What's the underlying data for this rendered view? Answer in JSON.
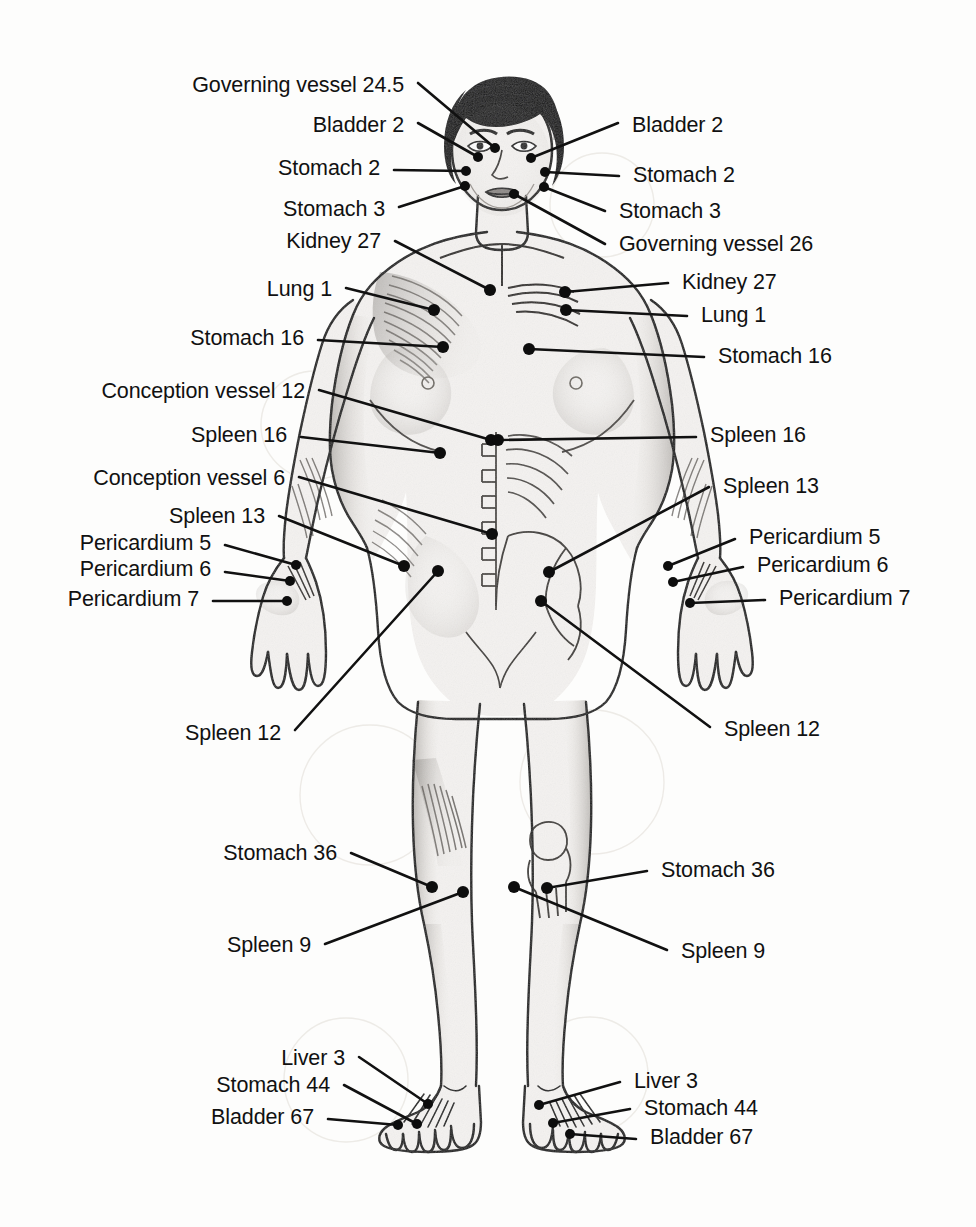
{
  "diagram": {
    "style": {
      "background": "#fdfdfc",
      "ink": "#111111",
      "point_color": "#0d0d0d",
      "skin_light": "#f2f0ee",
      "shade_mid": "#b9b4ae",
      "shade_dark": "#6e6a66",
      "hair_color": "#111111",
      "watermark_circle": "#e2ded8"
    }
  },
  "labels_left": [
    {
      "id": "gv245-l",
      "text": "Governing vessel 24.5",
      "x": 404,
      "y": 90,
      "tip_x": 495,
      "tip_y": 148,
      "elbow_x": 418,
      "elbow_y": 83
    },
    {
      "id": "bl2-l",
      "text": "Bladder 2",
      "x": 404,
      "y": 130,
      "tip_x": 478,
      "tip_y": 157,
      "elbow_x": 418,
      "elbow_y": 123
    },
    {
      "id": "st2-l",
      "text": "Stomach 2",
      "x": 380,
      "y": 173,
      "tip_x": 466,
      "tip_y": 171,
      "elbow_x": 394,
      "elbow_y": 170
    },
    {
      "id": "st3-l",
      "text": "Stomach 3",
      "x": 385,
      "y": 214,
      "tip_x": 465,
      "tip_y": 186,
      "elbow_x": 399,
      "elbow_y": 207
    },
    {
      "id": "ki27-l",
      "text": "Kidney 27",
      "x": 381,
      "y": 246,
      "tip_x": 490,
      "tip_y": 290,
      "elbow_x": 395,
      "elbow_y": 241
    },
    {
      "id": "lu1-l",
      "text": "Lung 1",
      "x": 332,
      "y": 294,
      "tip_x": 434,
      "tip_y": 310,
      "elbow_x": 346,
      "elbow_y": 288
    },
    {
      "id": "st16-l",
      "text": "Stomach 16",
      "x": 304,
      "y": 343,
      "tip_x": 443,
      "tip_y": 347,
      "elbow_x": 318,
      "elbow_y": 340
    },
    {
      "id": "cv12-l",
      "text": "Conception vessel 12",
      "x": 305,
      "y": 396,
      "tip_x": 491,
      "tip_y": 440,
      "elbow_x": 319,
      "elbow_y": 390
    },
    {
      "id": "sp16-l",
      "text": "Spleen 16",
      "x": 287,
      "y": 440,
      "tip_x": 440,
      "tip_y": 453,
      "elbow_x": 301,
      "elbow_y": 437
    },
    {
      "id": "cv6-l",
      "text": "Conception vessel 6",
      "x": 285,
      "y": 483,
      "tip_x": 492,
      "tip_y": 534,
      "elbow_x": 299,
      "elbow_y": 477
    },
    {
      "id": "sp13-l",
      "text": "Spleen 13",
      "x": 265,
      "y": 521,
      "tip_x": 404,
      "tip_y": 566,
      "elbow_x": 279,
      "elbow_y": 516
    },
    {
      "id": "pc5-l",
      "text": "Pericardium 5",
      "x": 211,
      "y": 548,
      "tip_x": 296,
      "tip_y": 565,
      "elbow_x": 225,
      "elbow_y": 545
    },
    {
      "id": "pc6-l",
      "text": "Pericardium 6",
      "x": 211,
      "y": 574,
      "tip_x": 290,
      "tip_y": 581,
      "elbow_x": 225,
      "elbow_y": 572
    },
    {
      "id": "pc7-l",
      "text": "Pericardium 7",
      "x": 199,
      "y": 604,
      "tip_x": 287,
      "tip_y": 601,
      "elbow_x": 213,
      "elbow_y": 601
    },
    {
      "id": "sp12-l",
      "text": "Spleen 12",
      "x": 281,
      "y": 738,
      "tip_x": 438,
      "tip_y": 571,
      "elbow_x": 295,
      "elbow_y": 730
    },
    {
      "id": "st36-l",
      "text": "Stomach 36",
      "x": 337,
      "y": 858,
      "tip_x": 432,
      "tip_y": 887,
      "elbow_x": 351,
      "elbow_y": 853
    },
    {
      "id": "sp9-l",
      "text": "Spleen 9",
      "x": 311,
      "y": 950,
      "tip_x": 463,
      "tip_y": 892,
      "elbow_x": 325,
      "elbow_y": 944
    },
    {
      "id": "lv3-l",
      "text": "Liver 3",
      "x": 345,
      "y": 1063,
      "tip_x": 428,
      "tip_y": 1104,
      "elbow_x": 359,
      "elbow_y": 1057
    },
    {
      "id": "st44-l",
      "text": "Stomach 44",
      "x": 330,
      "y": 1090,
      "tip_x": 417,
      "tip_y": 1124,
      "elbow_x": 344,
      "elbow_y": 1085
    },
    {
      "id": "bl67-l",
      "text": "Bladder 67",
      "x": 314,
      "y": 1122,
      "tip_x": 398,
      "tip_y": 1125,
      "elbow_x": 328,
      "elbow_y": 1119
    }
  ],
  "labels_right": [
    {
      "id": "bl2-r",
      "text": "Bladder 2",
      "x": 632,
      "y": 130,
      "tip_x": 531,
      "tip_y": 158,
      "elbow_x": 618,
      "elbow_y": 123
    },
    {
      "id": "st2-r",
      "text": "Stomach 2",
      "x": 633,
      "y": 180,
      "tip_x": 545,
      "tip_y": 172,
      "elbow_x": 619,
      "elbow_y": 176
    },
    {
      "id": "st3-r",
      "text": "Stomach 3",
      "x": 619,
      "y": 216,
      "tip_x": 544,
      "tip_y": 187,
      "elbow_x": 605,
      "elbow_y": 211
    },
    {
      "id": "gv26-r",
      "text": "Governing vessel 26",
      "x": 619,
      "y": 249,
      "tip_x": 514,
      "tip_y": 194,
      "elbow_x": 605,
      "elbow_y": 244
    },
    {
      "id": "ki27-r",
      "text": "Kidney 27",
      "x": 682,
      "y": 287,
      "tip_x": 565,
      "tip_y": 292,
      "elbow_x": 668,
      "elbow_y": 283
    },
    {
      "id": "lu1-r",
      "text": "Lung 1",
      "x": 701,
      "y": 320,
      "tip_x": 566,
      "tip_y": 310,
      "elbow_x": 687,
      "elbow_y": 316
    },
    {
      "id": "st16-r",
      "text": "Stomach 16",
      "x": 718,
      "y": 361,
      "tip_x": 529,
      "tip_y": 349,
      "elbow_x": 704,
      "elbow_y": 357
    },
    {
      "id": "sp16-r",
      "text": "Spleen 16",
      "x": 710,
      "y": 440,
      "tip_x": 498,
      "tip_y": 440,
      "elbow_x": 696,
      "elbow_y": 437
    },
    {
      "id": "sp13-r",
      "text": "Spleen 13",
      "x": 723,
      "y": 491,
      "tip_x": 549,
      "tip_y": 572,
      "elbow_x": 709,
      "elbow_y": 487
    },
    {
      "id": "pc5-r",
      "text": "Pericardium 5",
      "x": 749,
      "y": 542,
      "tip_x": 668,
      "tip_y": 566,
      "elbow_x": 735,
      "elbow_y": 539
    },
    {
      "id": "pc6-r",
      "text": "Pericardium 6",
      "x": 757,
      "y": 570,
      "tip_x": 673,
      "tip_y": 582,
      "elbow_x": 743,
      "elbow_y": 567
    },
    {
      "id": "pc7-r",
      "text": "Pericardium 7",
      "x": 779,
      "y": 603,
      "tip_x": 690,
      "tip_y": 603,
      "elbow_x": 765,
      "elbow_y": 600
    },
    {
      "id": "sp12-r",
      "text": "Spleen 12",
      "x": 724,
      "y": 734,
      "tip_x": 541,
      "tip_y": 601,
      "elbow_x": 710,
      "elbow_y": 727
    },
    {
      "id": "st36-r",
      "text": "Stomach 36",
      "x": 661,
      "y": 875,
      "tip_x": 547,
      "tip_y": 888,
      "elbow_x": 647,
      "elbow_y": 871
    },
    {
      "id": "sp9-r",
      "text": "Spleen 9",
      "x": 681,
      "y": 956,
      "tip_x": 514,
      "tip_y": 887,
      "elbow_x": 667,
      "elbow_y": 950
    },
    {
      "id": "lv3-r",
      "text": "Liver 3",
      "x": 634,
      "y": 1086,
      "tip_x": 539,
      "tip_y": 1105,
      "elbow_x": 620,
      "elbow_y": 1082
    },
    {
      "id": "st44-r",
      "text": "Stomach 44",
      "x": 644,
      "y": 1113,
      "tip_x": 553,
      "tip_y": 1123,
      "elbow_x": 630,
      "elbow_y": 1109
    },
    {
      "id": "bl67-r",
      "text": "Bladder 67",
      "x": 650,
      "y": 1142,
      "tip_x": 570,
      "tip_y": 1134,
      "elbow_x": 636,
      "elbow_y": 1139
    }
  ],
  "points": [
    {
      "id": "gv245",
      "label": "Governing vessel 24.5",
      "x": 495,
      "y": 148,
      "r": 5
    },
    {
      "id": "bl2-a",
      "label": "Bladder 2",
      "x": 478,
      "y": 157,
      "r": 5
    },
    {
      "id": "bl2-b",
      "label": "Bladder 2",
      "x": 531,
      "y": 158,
      "r": 5
    },
    {
      "id": "st2-a",
      "label": "Stomach 2",
      "x": 466,
      "y": 171,
      "r": 5
    },
    {
      "id": "st2-b",
      "label": "Stomach 2",
      "x": 545,
      "y": 172,
      "r": 5
    },
    {
      "id": "st3-a",
      "label": "Stomach 3",
      "x": 465,
      "y": 186,
      "r": 5
    },
    {
      "id": "st3-b",
      "label": "Stomach 3",
      "x": 544,
      "y": 187,
      "r": 5
    },
    {
      "id": "gv26",
      "label": "Governing vessel 26",
      "x": 514,
      "y": 194,
      "r": 5
    },
    {
      "id": "ki27a",
      "label": "Kidney 27",
      "x": 490,
      "y": 290,
      "r": 6
    },
    {
      "id": "ki27b",
      "label": "Kidney 27",
      "x": 565,
      "y": 292,
      "r": 6
    },
    {
      "id": "lu1a",
      "label": "Lung 1",
      "x": 434,
      "y": 310,
      "r": 6
    },
    {
      "id": "lu1b",
      "label": "Lung 1",
      "x": 566,
      "y": 310,
      "r": 6
    },
    {
      "id": "st16a",
      "label": "Stomach 16",
      "x": 443,
      "y": 347,
      "r": 6
    },
    {
      "id": "st16b",
      "label": "Stomach 16",
      "x": 529,
      "y": 349,
      "r": 6
    },
    {
      "id": "cv12",
      "label": "Conception vessel 12",
      "x": 491,
      "y": 440,
      "r": 6
    },
    {
      "id": "sp16a",
      "label": "Spleen 16",
      "x": 440,
      "y": 453,
      "r": 6
    },
    {
      "id": "sp16b",
      "label": "Spleen 16",
      "x": 498,
      "y": 440,
      "r": 6
    },
    {
      "id": "cv6",
      "label": "Conception vessel 6",
      "x": 492,
      "y": 534,
      "r": 6
    },
    {
      "id": "sp13a",
      "label": "Spleen 13",
      "x": 404,
      "y": 566,
      "r": 6
    },
    {
      "id": "sp13b",
      "label": "Spleen 13",
      "x": 549,
      "y": 572,
      "r": 6
    },
    {
      "id": "sp12a",
      "label": "Spleen 12",
      "x": 438,
      "y": 571,
      "r": 6
    },
    {
      "id": "sp12b",
      "label": "Spleen 12",
      "x": 541,
      "y": 601,
      "r": 6
    },
    {
      "id": "pc5a",
      "label": "Pericardium 5",
      "x": 296,
      "y": 565,
      "r": 5
    },
    {
      "id": "pc5b",
      "label": "Pericardium 5",
      "x": 668,
      "y": 566,
      "r": 5
    },
    {
      "id": "pc6a",
      "label": "Pericardium 6",
      "x": 290,
      "y": 581,
      "r": 5
    },
    {
      "id": "pc6b",
      "label": "Pericardium 6",
      "x": 673,
      "y": 582,
      "r": 5
    },
    {
      "id": "pc7a",
      "label": "Pericardium 7",
      "x": 287,
      "y": 601,
      "r": 5
    },
    {
      "id": "pc7b",
      "label": "Pericardium 7",
      "x": 690,
      "y": 603,
      "r": 5
    },
    {
      "id": "st36a",
      "label": "Stomach 36",
      "x": 432,
      "y": 887,
      "r": 6
    },
    {
      "id": "st36b",
      "label": "Stomach 36",
      "x": 547,
      "y": 888,
      "r": 6
    },
    {
      "id": "sp9a",
      "label": "Spleen 9",
      "x": 463,
      "y": 892,
      "r": 6
    },
    {
      "id": "sp9b",
      "label": "Spleen 9",
      "x": 514,
      "y": 887,
      "r": 6
    },
    {
      "id": "lv3a",
      "label": "Liver 3",
      "x": 428,
      "y": 1104,
      "r": 5
    },
    {
      "id": "lv3b",
      "label": "Liver 3",
      "x": 539,
      "y": 1105,
      "r": 5
    },
    {
      "id": "st44a",
      "label": "Stomach 44",
      "x": 417,
      "y": 1124,
      "r": 5
    },
    {
      "id": "st44b",
      "label": "Stomach 44",
      "x": 553,
      "y": 1123,
      "r": 5
    },
    {
      "id": "bl67a",
      "label": "Bladder 67",
      "x": 398,
      "y": 1125,
      "r": 5
    },
    {
      "id": "bl67b",
      "label": "Bladder 67",
      "x": 570,
      "y": 1134,
      "r": 5
    }
  ]
}
